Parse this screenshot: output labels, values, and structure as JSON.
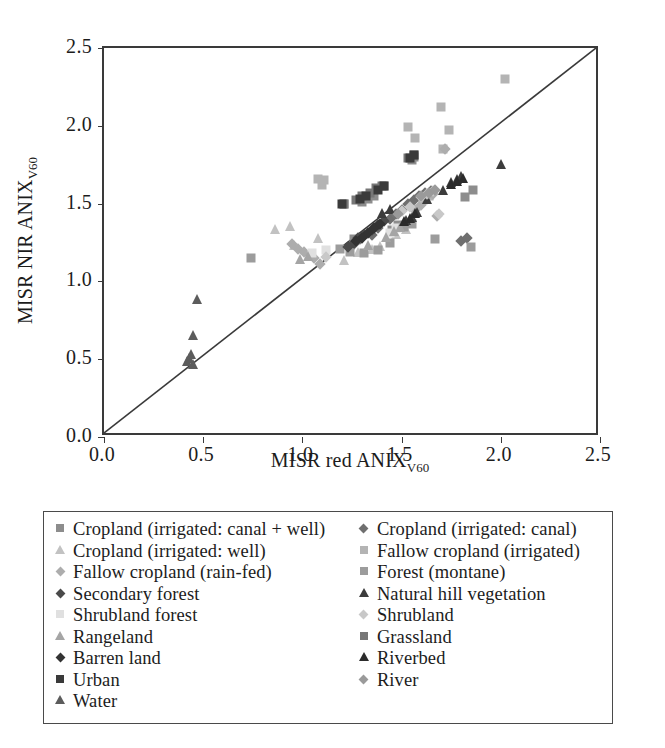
{
  "figure": {
    "background": "#ffffff"
  },
  "chart_data": {
    "type": "scatter",
    "title": "",
    "xlabel": "MISR red ANIX",
    "xlabel_subscript": "V60",
    "ylabel": "MISR NIR ANIX",
    "ylabel_subscript": "V60",
    "xlim": [
      0.0,
      2.5
    ],
    "ylim": [
      0.0,
      2.5
    ],
    "xticks": [
      "0.0",
      "0.5",
      "1.0",
      "1.5",
      "2.0",
      "2.5"
    ],
    "yticks": [
      "0.0",
      "0.5",
      "1.0",
      "1.5",
      "2.0",
      "2.5"
    ],
    "xtick_values": [
      0.0,
      0.5,
      1.0,
      1.5,
      2.0,
      2.5
    ],
    "ytick_values": [
      0.0,
      0.5,
      1.0,
      1.5,
      2.0,
      2.5
    ],
    "grid": false,
    "legend_position": "below-plot",
    "reference_line": {
      "name": "one-to-one-line",
      "from": [
        0.0,
        0.0
      ],
      "to": [
        2.5,
        2.5
      ],
      "color": "#3a3a3a"
    },
    "series": [
      {
        "name": "Cropland (irrigated: canal + well)",
        "marker": "square",
        "color": "#8d8d8d",
        "points": [
          [
            1.3,
            1.51
          ],
          [
            1.33,
            1.53
          ],
          [
            1.36,
            1.55
          ],
          [
            1.41,
            1.61
          ],
          [
            1.21,
            1.5
          ],
          [
            1.55,
            1.78
          ],
          [
            1.56,
            1.8
          ],
          [
            1.26,
            1.27
          ],
          [
            1.45,
            1.33
          ],
          [
            1.48,
            1.36
          ],
          [
            1.82,
            1.54
          ],
          [
            1.86,
            1.59
          ]
        ]
      },
      {
        "name": "Cropland (irrigated: canal)",
        "marker": "diamond",
        "color": "#6f6f6f",
        "points": [
          [
            1.44,
            1.4
          ],
          [
            1.47,
            1.43
          ],
          [
            1.5,
            1.46
          ],
          [
            1.53,
            1.5
          ],
          [
            1.56,
            1.52
          ],
          [
            1.59,
            1.55
          ],
          [
            1.62,
            1.57
          ],
          [
            1.65,
            1.58
          ],
          [
            1.38,
            1.34
          ],
          [
            1.35,
            1.3
          ],
          [
            1.8,
            1.26
          ],
          [
            1.83,
            1.28
          ],
          [
            1.29,
            1.27
          ],
          [
            1.26,
            1.24
          ]
        ]
      },
      {
        "name": "Cropland (irrigated: well)",
        "marker": "triangle",
        "color": "#c2c2c2",
        "points": [
          [
            0.86,
            1.33
          ],
          [
            0.94,
            1.35
          ],
          [
            1.08,
            1.27
          ],
          [
            1.21,
            1.13
          ],
          [
            1.39,
            1.22
          ],
          [
            1.47,
            1.3
          ],
          [
            1.52,
            1.33
          ],
          [
            1.28,
            1.18
          ],
          [
            1.35,
            1.2
          ],
          [
            0.96,
            1.23
          ]
        ]
      },
      {
        "name": "Fallow cropland (irrigated)",
        "marker": "square",
        "color": "#b4b4b4",
        "points": [
          [
            1.08,
            1.66
          ],
          [
            1.11,
            1.65
          ],
          [
            1.1,
            1.62
          ],
          [
            1.53,
            1.99
          ],
          [
            1.57,
            1.92
          ],
          [
            1.7,
            2.12
          ],
          [
            1.74,
            1.97
          ],
          [
            2.02,
            2.3
          ],
          [
            1.71,
            1.85
          ],
          [
            1.64,
            1.55
          ],
          [
            1.61,
            1.52
          ]
        ]
      },
      {
        "name": "Fallow cropland (rain-fed)",
        "marker": "diamond",
        "color": "#adadad",
        "points": [
          [
            0.95,
            1.24
          ],
          [
            0.98,
            1.21
          ],
          [
            1.01,
            1.19
          ],
          [
            1.04,
            1.17
          ],
          [
            1.06,
            1.15
          ],
          [
            1.09,
            1.11
          ],
          [
            1.57,
            1.46
          ],
          [
            1.6,
            1.49
          ],
          [
            1.68,
            1.42
          ],
          [
            1.72,
            1.85
          ],
          [
            1.66,
            1.56
          ]
        ]
      },
      {
        "name": "Forest (montane)",
        "marker": "square",
        "color": "#9c9c9c",
        "points": [
          [
            0.74,
            1.15
          ],
          [
            1.19,
            1.21
          ],
          [
            1.24,
            1.19
          ],
          [
            1.31,
            1.18
          ],
          [
            1.38,
            1.2
          ],
          [
            1.51,
            1.35
          ],
          [
            1.55,
            1.37
          ],
          [
            1.67,
            1.27
          ],
          [
            1.85,
            1.22
          ],
          [
            1.44,
            1.25
          ]
        ]
      },
      {
        "name": "Secondary forest",
        "marker": "diamond",
        "color": "#4a4a4a",
        "points": [
          [
            1.28,
            1.28
          ],
          [
            1.31,
            1.3
          ],
          [
            1.35,
            1.33
          ],
          [
            1.38,
            1.36
          ],
          [
            1.41,
            1.39
          ],
          [
            1.26,
            1.25
          ],
          [
            1.23,
            1.22
          ]
        ]
      },
      {
        "name": "Natural hill vegetation",
        "marker": "triangle",
        "color": "#3c3c3c",
        "points": [
          [
            1.4,
            1.43
          ],
          [
            1.44,
            1.46
          ],
          [
            1.52,
            1.39
          ],
          [
            1.55,
            1.41
          ],
          [
            1.63,
            1.52
          ],
          [
            1.71,
            1.58
          ],
          [
            1.75,
            1.63
          ],
          [
            1.78,
            1.65
          ],
          [
            1.8,
            1.67
          ],
          [
            2.0,
            1.75
          ],
          [
            1.58,
            1.44
          ]
        ]
      },
      {
        "name": "Shrubland forest",
        "marker": "square",
        "color": "#e0e0e0",
        "points": [
          [
            1.05,
            1.18
          ],
          [
            1.12,
            1.2
          ],
          [
            1.44,
            1.31
          ],
          [
            1.47,
            1.34
          ]
        ]
      },
      {
        "name": "Shrubland",
        "marker": "diamond",
        "color": "#c8c8c8",
        "points": [
          [
            1.5,
            1.45
          ],
          [
            1.54,
            1.48
          ],
          [
            1.6,
            1.54
          ],
          [
            1.63,
            1.56
          ],
          [
            1.66,
            1.58
          ],
          [
            1.69,
            1.43
          ],
          [
            1.12,
            1.16
          ]
        ]
      },
      {
        "name": "Rangeland",
        "marker": "triangle",
        "color": "#a5a5a5",
        "points": [
          [
            1.03,
            1.16
          ],
          [
            1.42,
            1.28
          ],
          [
            1.46,
            1.32
          ],
          [
            1.49,
            1.34
          ],
          [
            0.99,
            1.14
          ],
          [
            1.33,
            1.23
          ]
        ]
      },
      {
        "name": "Grassland",
        "marker": "square",
        "color": "#777777",
        "points": [
          [
            1.27,
            1.52
          ],
          [
            1.3,
            1.55
          ],
          [
            1.34,
            1.57
          ],
          [
            1.37,
            1.6
          ],
          [
            1.4,
            1.61
          ],
          [
            1.21,
            1.5
          ],
          [
            1.53,
            1.79
          ],
          [
            1.56,
            1.81
          ]
        ]
      },
      {
        "name": "Barren land",
        "marker": "diamond",
        "color": "#333333",
        "points": [
          [
            1.33,
            1.31
          ],
          [
            1.36,
            1.34
          ],
          [
            1.39,
            1.37
          ],
          [
            1.3,
            1.28
          ],
          [
            1.27,
            1.26
          ]
        ]
      },
      {
        "name": "Riverbed",
        "marker": "triangle",
        "color": "#2b2b2b",
        "points": [
          [
            1.51,
            1.38
          ],
          [
            1.54,
            1.4
          ],
          [
            1.57,
            1.43
          ],
          [
            1.75,
            1.62
          ],
          [
            1.78,
            1.64
          ],
          [
            1.81,
            1.66
          ]
        ]
      },
      {
        "name": "Urban",
        "marker": "square",
        "color": "#3a3a3a",
        "points": [
          [
            1.2,
            1.5
          ],
          [
            1.29,
            1.53
          ],
          [
            1.32,
            1.55
          ],
          [
            1.38,
            1.59
          ],
          [
            1.41,
            1.61
          ],
          [
            1.54,
            1.79
          ],
          [
            1.56,
            1.81
          ]
        ]
      },
      {
        "name": "River",
        "marker": "diamond",
        "color": "#9a9a9a",
        "points": [
          [
            1.6,
            1.55
          ],
          [
            1.64,
            1.57
          ],
          [
            1.67,
            1.59
          ],
          [
            1.48,
            1.43
          ]
        ]
      },
      {
        "name": "Water",
        "marker": "triangle",
        "color": "#5c5c5c",
        "points": [
          [
            0.43,
            0.5
          ],
          [
            0.44,
            0.53
          ],
          [
            0.42,
            0.48
          ],
          [
            0.45,
            0.46
          ],
          [
            0.45,
            0.65
          ],
          [
            0.47,
            0.88
          ]
        ]
      }
    ]
  },
  "legend": {
    "columns": [
      {
        "items": [
          {
            "label": "Cropland (irrigated: canal + well)",
            "marker": "square",
            "color": "#8d8d8d"
          },
          {
            "label": "Cropland (irrigated: well)",
            "marker": "triangle",
            "color": "#c2c2c2"
          },
          {
            "label": "Fallow cropland (rain-fed)",
            "marker": "diamond",
            "color": "#adadad"
          },
          {
            "label": "Secondary forest",
            "marker": "diamond",
            "color": "#4a4a4a"
          },
          {
            "label": "Shrubland forest",
            "marker": "square",
            "color": "#e0e0e0"
          },
          {
            "label": "Rangeland",
            "marker": "triangle",
            "color": "#a5a5a5"
          },
          {
            "label": "Barren land",
            "marker": "diamond",
            "color": "#333333"
          },
          {
            "label": "Urban",
            "marker": "square",
            "color": "#3a3a3a"
          },
          {
            "label": "Water",
            "marker": "triangle",
            "color": "#5c5c5c"
          }
        ]
      },
      {
        "items": [
          {
            "label": "Cropland (irrigated: canal)",
            "marker": "diamond",
            "color": "#6f6f6f"
          },
          {
            "label": "Fallow cropland (irrigated)",
            "marker": "square",
            "color": "#b4b4b4"
          },
          {
            "label": "Forest (montane)",
            "marker": "square",
            "color": "#9c9c9c"
          },
          {
            "label": "Natural hill vegetation",
            "marker": "triangle",
            "color": "#3c3c3c"
          },
          {
            "label": "Shrubland",
            "marker": "diamond",
            "color": "#c8c8c8"
          },
          {
            "label": "Grassland",
            "marker": "square",
            "color": "#777777"
          },
          {
            "label": "Riverbed",
            "marker": "triangle",
            "color": "#2b2b2b"
          },
          {
            "label": "River",
            "marker": "diamond",
            "color": "#9a9a9a"
          }
        ]
      }
    ]
  }
}
